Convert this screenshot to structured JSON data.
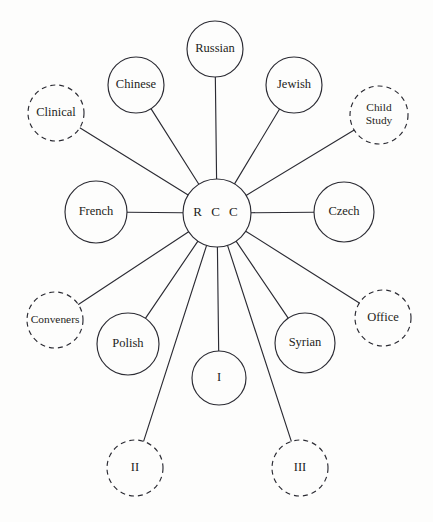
{
  "diagram": {
    "type": "hub-and-spoke-network",
    "canvas": {
      "width": 433,
      "height": 522
    },
    "style": {
      "background_color": "#fdfdfc",
      "stroke_color": "#2b2b33",
      "text_color": "#1d1d22",
      "solid_border_meaning": "solid-circle",
      "dashed_border_meaning": "dashed-circle"
    },
    "hub": {
      "id": "rcc",
      "label": "R C C",
      "cx": 217,
      "cy": 213,
      "r": 34,
      "border": "solid"
    },
    "nodes": [
      {
        "id": "clinical",
        "label": "Clinical",
        "cx": 56,
        "cy": 113,
        "r": 28,
        "border": "dashed",
        "lines": [
          "Clinical"
        ]
      },
      {
        "id": "chinese",
        "label": "Chinese",
        "cx": 136,
        "cy": 85,
        "r": 28,
        "border": "solid",
        "lines": [
          "Chinese"
        ]
      },
      {
        "id": "russian",
        "label": "Russian",
        "cx": 215,
        "cy": 49,
        "r": 28,
        "border": "solid",
        "lines": [
          "Russian"
        ]
      },
      {
        "id": "jewish",
        "label": "Jewish",
        "cx": 294,
        "cy": 85,
        "r": 28,
        "border": "solid",
        "lines": [
          "Jewish"
        ]
      },
      {
        "id": "child-study",
        "label": "Child Study",
        "cx": 379,
        "cy": 115,
        "r": 29,
        "border": "dashed",
        "lines": [
          "Child",
          "Study"
        ]
      },
      {
        "id": "french",
        "label": "French",
        "cx": 96,
        "cy": 212,
        "r": 31,
        "border": "solid",
        "lines": [
          "French"
        ]
      },
      {
        "id": "czech",
        "label": "Czech",
        "cx": 344,
        "cy": 212,
        "r": 30,
        "border": "solid",
        "lines": [
          "Czech"
        ]
      },
      {
        "id": "conveners",
        "label": "Conveners",
        "cx": 55,
        "cy": 320,
        "r": 28,
        "border": "dashed",
        "lines": [
          "Conveners"
        ]
      },
      {
        "id": "office",
        "label": "Office",
        "cx": 383,
        "cy": 318,
        "r": 28,
        "border": "dashed",
        "lines": [
          "Office"
        ]
      },
      {
        "id": "polish",
        "label": "Polish",
        "cx": 128,
        "cy": 344,
        "r": 31,
        "border": "solid",
        "lines": [
          "Polish"
        ]
      },
      {
        "id": "syrian",
        "label": "Syrian",
        "cx": 305,
        "cy": 343,
        "r": 30,
        "border": "solid",
        "lines": [
          "Syrian"
        ]
      },
      {
        "id": "one",
        "label": "I",
        "cx": 219,
        "cy": 378,
        "r": 27,
        "border": "solid",
        "lines": [
          "I"
        ]
      },
      {
        "id": "two",
        "label": "II",
        "cx": 135,
        "cy": 468,
        "r": 28,
        "border": "dashed",
        "lines": [
          "II"
        ]
      },
      {
        "id": "three",
        "label": "III",
        "cx": 300,
        "cy": 468,
        "r": 28,
        "border": "dashed",
        "lines": [
          "III"
        ]
      }
    ],
    "edges": [
      {
        "id": "edge-rcc-clinical",
        "from": "rcc",
        "to": "clinical"
      },
      {
        "id": "edge-rcc-chinese",
        "from": "rcc",
        "to": "chinese"
      },
      {
        "id": "edge-rcc-russian",
        "from": "rcc",
        "to": "russian"
      },
      {
        "id": "edge-rcc-jewish",
        "from": "rcc",
        "to": "jewish"
      },
      {
        "id": "edge-rcc-child-study",
        "from": "rcc",
        "to": "child-study"
      },
      {
        "id": "edge-rcc-french",
        "from": "rcc",
        "to": "french"
      },
      {
        "id": "edge-rcc-czech",
        "from": "rcc",
        "to": "czech"
      },
      {
        "id": "edge-rcc-conveners",
        "from": "rcc",
        "to": "conveners"
      },
      {
        "id": "edge-rcc-office",
        "from": "rcc",
        "to": "office"
      },
      {
        "id": "edge-rcc-polish",
        "from": "rcc",
        "to": "polish"
      },
      {
        "id": "edge-rcc-syrian",
        "from": "rcc",
        "to": "syrian"
      },
      {
        "id": "edge-rcc-one",
        "from": "rcc",
        "to": "one"
      },
      {
        "id": "edge-rcc-two",
        "from": "rcc",
        "to": "two"
      },
      {
        "id": "edge-rcc-three",
        "from": "rcc",
        "to": "three"
      }
    ]
  }
}
